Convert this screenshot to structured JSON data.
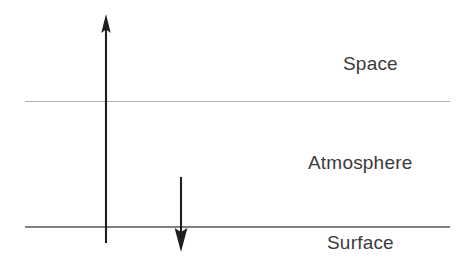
{
  "diagram": {
    "background_color": "#ffffff",
    "width": 472,
    "height": 268,
    "labels": {
      "space": "Space",
      "atmosphere": "Atmosphere",
      "surface": "Surface"
    },
    "label_color": "#3b3b3b",
    "boundaries": [
      {
        "name": "space-atmosphere-boundary",
        "y": 101,
        "x_start": 25,
        "x_end": 450,
        "color": "#b0b0b0",
        "thickness": 1
      },
      {
        "name": "surface-line",
        "y": 227,
        "x_start": 25,
        "x_end": 450,
        "color": "#6f6f6f",
        "thickness": 2
      }
    ],
    "arrows": [
      {
        "name": "upward-arrow",
        "direction": "up",
        "x": 106,
        "y_tail": 243,
        "y_tip": 14,
        "color": "#1f1f1f",
        "description": "Upward arrow from surface through atmosphere into space"
      },
      {
        "name": "downward-arrow",
        "direction": "down",
        "x": 181,
        "y_tail": 177,
        "y_tip": 252,
        "color": "#1f1f1f",
        "description": "Downward arrow from within atmosphere to below surface"
      }
    ]
  }
}
